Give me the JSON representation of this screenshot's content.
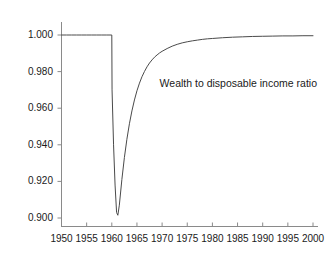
{
  "chart_data": {
    "type": "line",
    "title": "",
    "subtitle": "",
    "xlabel": "",
    "ylabel": "",
    "xlim": [
      1950,
      2000
    ],
    "ylim": [
      0.9,
      1.0
    ],
    "grid": false,
    "legend": null,
    "legend_position": "none",
    "line_color": "#444444",
    "axis_color": "#808080",
    "background": "#ffffff",
    "annotations": [
      {
        "text": "Wealth to disposable income ratio",
        "x": 1969.5,
        "y": 0.9735
      }
    ],
    "xticks": [
      1950,
      1955,
      1960,
      1965,
      1970,
      1975,
      1980,
      1985,
      1990,
      1995,
      2000
    ],
    "xtick_labels": [
      "1950",
      "1955",
      "1960",
      "1965",
      "1970",
      "1975",
      "1980",
      "1985",
      "1990",
      "1995",
      "2000"
    ],
    "yticks": [
      0.9,
      0.92,
      0.94,
      0.96,
      0.98,
      1.0
    ],
    "ytick_labels": [
      "0.900",
      "0.920",
      "0.940",
      "0.960",
      "0.980",
      "1.000"
    ],
    "series": [
      {
        "name": "Wealth to disposable income ratio",
        "x": [
          1950,
          1951,
          1952,
          1953,
          1954,
          1955,
          1956,
          1957,
          1958,
          1959,
          1960,
          1960.05,
          1960.35,
          1960.65,
          1960.95,
          1961.2,
          1961.5,
          1962,
          1962.5,
          1963,
          1963.5,
          1964,
          1964.5,
          1965,
          1965.5,
          1966,
          1966.5,
          1967,
          1967.5,
          1968,
          1968.5,
          1969,
          1969.5,
          1970,
          1971,
          1972,
          1973,
          1974,
          1975,
          1976,
          1977,
          1978,
          1979,
          1980,
          1982,
          1984,
          1986,
          1988,
          1990,
          1992,
          1994,
          1996,
          1998,
          2000
        ],
        "y": [
          1.0,
          1.0,
          1.0,
          1.0,
          1.0,
          1.0,
          1.0,
          1.0,
          1.0,
          1.0,
          1.0,
          0.97,
          0.94,
          0.918,
          0.903,
          0.9015,
          0.907,
          0.921,
          0.933,
          0.943,
          0.9515,
          0.9585,
          0.9645,
          0.9695,
          0.9737,
          0.9772,
          0.9801,
          0.9826,
          0.9847,
          0.9864,
          0.9879,
          0.9891,
          0.9902,
          0.9911,
          0.9926,
          0.9939,
          0.9949,
          0.9957,
          0.9963,
          0.9968,
          0.9972,
          0.9976,
          0.9979,
          0.9981,
          0.9985,
          0.9988,
          0.999,
          0.9992,
          0.9993,
          0.9994,
          0.9995,
          0.9995,
          0.9996,
          0.9996
        ]
      }
    ]
  },
  "axes": {
    "y_axis_name": "y-axis",
    "x_axis_name": "x-axis"
  }
}
